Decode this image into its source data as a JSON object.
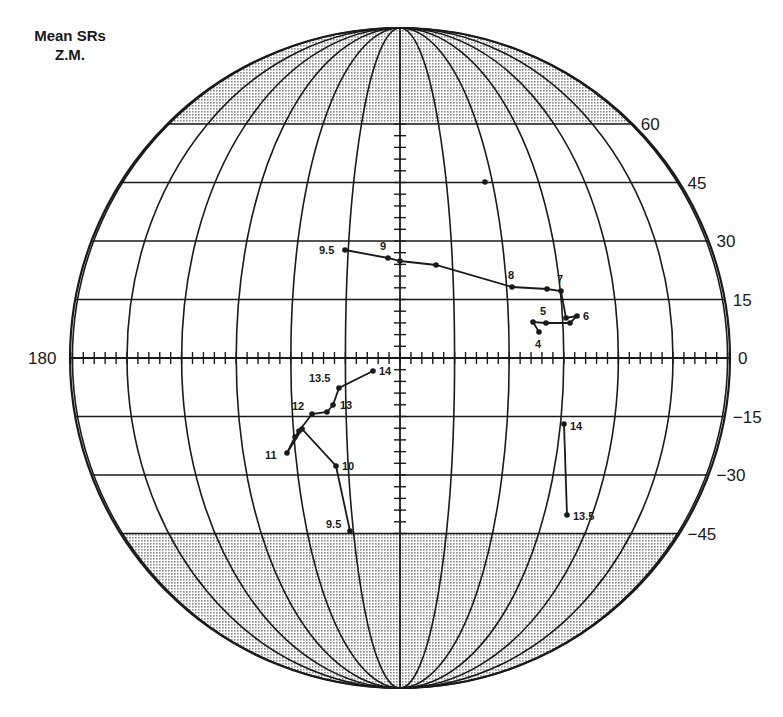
{
  "title": {
    "line1": "Mean SRs",
    "line2": "Z.M."
  },
  "colors": {
    "ink": "#1a1a1a",
    "shade": "#c8c8c8",
    "background": "#ffffff"
  },
  "chart_data": {
    "type": "scatter",
    "title": "Mean SRs Z.M.",
    "projection": "globe (orthographic-style disk), latitude/longitude grid",
    "grid": true,
    "shaded_bands": [
      "lat > 60",
      "lat < -45"
    ],
    "axis": {
      "equator_left_label": "180",
      "latitude_tick_labels": [
        "60",
        "45",
        "30",
        "15",
        "0",
        "-15",
        "-30",
        "-45"
      ],
      "longitude_range": [
        -180,
        180
      ],
      "latitude_step": 15,
      "longitude_step": 15
    },
    "series": [
      {
        "name": "northern track",
        "points": [
          {
            "label": "9.5",
            "lon": -15,
            "lat": 28,
            "px": [
              345,
              250
            ]
          },
          {
            "label": "9",
            "lon": -3,
            "lat": 26,
            "px": [
              388,
              258
            ]
          },
          {
            "label": "",
            "lon": 0,
            "lat": 25,
            "px": [
              400,
              261
            ]
          },
          {
            "label": "",
            "lon": 10,
            "lat": 24,
            "px": [
              436,
              265
            ]
          },
          {
            "label": "8",
            "lon": 31,
            "lat": 18,
            "px": [
              512,
              287
            ]
          },
          {
            "label": "",
            "lon": 41,
            "lat": 18,
            "px": [
              547,
              289
            ]
          },
          {
            "label": "7",
            "lon": 45,
            "lat": 17,
            "px": [
              561,
              291
            ]
          },
          {
            "label": "",
            "lon": 46,
            "lat": 10,
            "px": [
              566,
              318
            ]
          },
          {
            "label": "6",
            "lon": 49,
            "lat": 11,
            "px": [
              577,
              316
            ]
          },
          {
            "label": "",
            "lon": 46,
            "lat": 9,
            "px": [
              570,
              323
            ]
          },
          {
            "label": "5",
            "lon": 40,
            "lat": 9,
            "px": [
              546,
              323
            ]
          },
          {
            "label": "",
            "lon": 36,
            "lat": 9,
            "px": [
              533,
              322
            ]
          },
          {
            "label": "4",
            "lon": 38,
            "lat": 6,
            "px": [
              539,
              332
            ]
          }
        ]
      },
      {
        "name": "southern track",
        "points": [
          {
            "label": "14",
            "lon": -7,
            "lat": -4,
            "px": [
              373,
              371
            ]
          },
          {
            "label": "13.5",
            "lon": -16,
            "lat": -9,
            "px": [
              339,
              388
            ]
          },
          {
            "label": "13",
            "lon": -18,
            "lat": -13,
            "px": [
              333,
              405
            ]
          },
          {
            "label": "",
            "lon": -20,
            "lat": -16,
            "px": [
              327,
              412
            ]
          },
          {
            "label": "12",
            "lon": -24,
            "lat": -17,
            "px": [
              312,
              414
            ]
          },
          {
            "label": "",
            "lon": -29,
            "lat": -20,
            "px": [
              299,
              431
            ]
          },
          {
            "label": "",
            "lon": -31,
            "lat": -22,
            "px": [
              295,
              437
            ]
          },
          {
            "label": "11",
            "lon": -31,
            "lat": -25,
            "px": [
              287,
              453
            ]
          },
          {
            "label": "",
            "lon": -26,
            "lat": -21,
            "px": [
              302,
              429
            ]
          },
          {
            "label": "10",
            "lon": -18,
            "lat": -28,
            "px": [
              336,
              466
            ]
          },
          {
            "label": "9.5",
            "lon": -15,
            "lat": -44,
            "px": [
              350,
              531
            ]
          }
        ]
      },
      {
        "name": "eastern track",
        "points": [
          {
            "label": "14",
            "lon": 45,
            "lat": -16,
            "px": [
              564,
              424
            ]
          },
          {
            "label": "13.5",
            "lon": 46,
            "lat": -40,
            "px": [
              567,
              515
            ]
          }
        ]
      },
      {
        "name": "isolated point",
        "points": [
          {
            "label": "",
            "lon": 23,
            "lat": 45,
            "px": [
              485,
              182
            ]
          }
        ]
      }
    ]
  }
}
